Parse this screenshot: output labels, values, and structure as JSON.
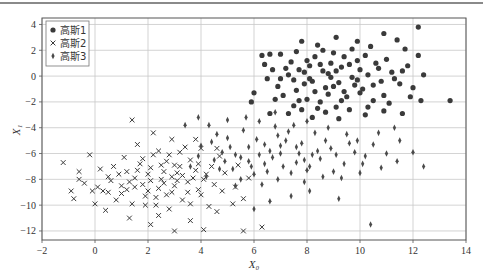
{
  "chart_data": {
    "type": "scatter",
    "title": "",
    "xlabel": "X₀",
    "ylabel": "X₁",
    "xlim": [
      -2,
      14
    ],
    "ylim": [
      -12.7,
      4.5
    ],
    "xticks": [
      -2,
      0,
      2,
      4,
      6,
      8,
      10,
      12,
      14
    ],
    "yticks": [
      -12,
      -10,
      -8,
      -6,
      -4,
      -2,
      0,
      2,
      4
    ],
    "xtick_labels": [
      "−2",
      "0",
      "2",
      "4",
      "6",
      "8",
      "10",
      "12",
      "14"
    ],
    "ytick_labels": [
      "−12",
      "−10",
      "−8",
      "−6",
      "−4",
      "−2",
      "0",
      "2",
      "4"
    ],
    "grid": true,
    "legend_position": "top-left",
    "series": [
      {
        "name": "高斯1",
        "marker": "circle",
        "color": "#3a3a3a",
        "points": [
          [
            8.8,
            0.2
          ],
          [
            9.2,
            -0.5
          ],
          [
            8.1,
            0.8
          ],
          [
            9.9,
            1.2
          ],
          [
            7.6,
            -1.1
          ],
          [
            8.5,
            -2.0
          ],
          [
            10.3,
            0.1
          ],
          [
            9.0,
            1.8
          ],
          [
            7.9,
            0.3
          ],
          [
            8.7,
            -0.9
          ],
          [
            10.8,
            -0.4
          ],
          [
            9.5,
            -1.6
          ],
          [
            7.2,
            0.6
          ],
          [
            8.3,
            1.5
          ],
          [
            9.7,
            2.1
          ],
          [
            10.1,
            -1.0
          ],
          [
            8.9,
            -0.1
          ],
          [
            7.5,
            -0.3
          ],
          [
            9.3,
            0.7
          ],
          [
            8.0,
            -1.8
          ],
          [
            6.9,
            -0.8
          ],
          [
            10.6,
            1.0
          ],
          [
            11.2,
            0.3
          ],
          [
            9.1,
            -2.4
          ],
          [
            8.4,
            2.4
          ],
          [
            7.0,
            1.7
          ],
          [
            6.5,
            -0.2
          ],
          [
            9.8,
            -0.7
          ],
          [
            10.9,
            -1.5
          ],
          [
            8.6,
            0.4
          ],
          [
            7.8,
            -2.6
          ],
          [
            9.6,
            0.9
          ],
          [
            10.4,
            2.3
          ],
          [
            11.5,
            -0.6
          ],
          [
            8.2,
            -0.4
          ],
          [
            7.4,
            1.1
          ],
          [
            6.7,
            0.5
          ],
          [
            9.4,
            -1.2
          ],
          [
            10.0,
            0.5
          ],
          [
            8.8,
            -1.4
          ],
          [
            7.1,
            -1.5
          ],
          [
            11.8,
            0.8
          ],
          [
            12.0,
            -0.9
          ],
          [
            12.2,
            1.6
          ],
          [
            11.9,
            -1.6
          ],
          [
            12.3,
            -1.9
          ],
          [
            13.4,
            -1.9
          ],
          [
            12.2,
            3.8
          ],
          [
            10.9,
            3.3
          ],
          [
            11.4,
            2.8
          ],
          [
            9.9,
            2.7
          ],
          [
            9.1,
            3.0
          ],
          [
            7.8,
            2.7
          ],
          [
            6.6,
            1.7
          ],
          [
            6.3,
            1.6
          ],
          [
            6.0,
            -1.3
          ],
          [
            5.9,
            -2.0
          ],
          [
            6.6,
            -2.9
          ],
          [
            7.3,
            -2.9
          ],
          [
            8.2,
            -3.2
          ],
          [
            9.2,
            -3.3
          ],
          [
            10.2,
            -3.0
          ],
          [
            10.9,
            -2.7
          ],
          [
            11.6,
            -2.9
          ],
          [
            9.6,
            -2.6
          ],
          [
            8.4,
            -2.5
          ],
          [
            7.7,
            -1.9
          ],
          [
            10.5,
            -1.9
          ],
          [
            11.1,
            -2.1
          ],
          [
            6.8,
            -1.8
          ],
          [
            8.0,
            1.2
          ],
          [
            8.9,
            1.0
          ],
          [
            9.4,
            1.5
          ],
          [
            10.2,
            1.6
          ],
          [
            7.3,
            0.1
          ],
          [
            7.9,
            -0.6
          ],
          [
            8.3,
            -1.2
          ],
          [
            9.0,
            -0.8
          ],
          [
            9.9,
            -0.3
          ],
          [
            10.7,
            0.6
          ],
          [
            11.3,
            -0.2
          ],
          [
            11.0,
            1.3
          ],
          [
            8.6,
            2.0
          ],
          [
            7.6,
            1.9
          ],
          [
            6.4,
            0.9
          ],
          [
            7.0,
            -0.2
          ],
          [
            9.3,
            -1.9
          ],
          [
            10.3,
            -2.4
          ],
          [
            8.7,
            -2.8
          ],
          [
            7.5,
            -2.3
          ],
          [
            9.7,
            -0.1
          ],
          [
            8.5,
            0.9
          ],
          [
            9.1,
            0.4
          ],
          [
            10.0,
            -1.3
          ],
          [
            8.1,
            -0.2
          ],
          [
            7.7,
            0.5
          ],
          [
            10.5,
            -0.7
          ],
          [
            11.6,
            0.4
          ],
          [
            12.4,
            0.1
          ],
          [
            11.7,
            2.1
          ]
        ]
      },
      {
        "name": "高斯2",
        "marker": "x",
        "color": "#3a3a3a",
        "points": [
          [
            2.5,
            -8.0
          ],
          [
            3.1,
            -7.5
          ],
          [
            1.8,
            -8.4
          ],
          [
            2.9,
            -9.0
          ],
          [
            3.5,
            -8.2
          ],
          [
            2.1,
            -7.1
          ],
          [
            1.5,
            -7.9
          ],
          [
            3.8,
            -7.3
          ],
          [
            2.7,
            -6.6
          ],
          [
            1.2,
            -8.8
          ],
          [
            3.3,
            -9.6
          ],
          [
            4.1,
            -8.0
          ],
          [
            2.3,
            -9.4
          ],
          [
            1.7,
            -6.8
          ],
          [
            0.9,
            -7.6
          ],
          [
            4.4,
            -7.0
          ],
          [
            3.0,
            -8.5
          ],
          [
            2.0,
            -8.9
          ],
          [
            2.6,
            -7.4
          ],
          [
            3.6,
            -6.5
          ],
          [
            1.4,
            -9.9
          ],
          [
            4.0,
            -9.2
          ],
          [
            2.8,
            -10.3
          ],
          [
            1.1,
            -6.3
          ],
          [
            0.6,
            -8.1
          ],
          [
            4.7,
            -6.2
          ],
          [
            3.9,
            -8.8
          ],
          [
            2.2,
            -6.1
          ],
          [
            1.9,
            -10.0
          ],
          [
            3.2,
            -7.0
          ],
          [
            0.3,
            -8.9
          ],
          [
            4.3,
            -10.1
          ],
          [
            2.4,
            -5.8
          ],
          [
            1.6,
            -5.3
          ],
          [
            3.4,
            -5.5
          ],
          [
            0.8,
            -9.6
          ],
          [
            2.9,
            -4.9
          ],
          [
            4.9,
            -7.5
          ],
          [
            5.3,
            -8.6
          ],
          [
            5.6,
            -9.5
          ],
          [
            1.4,
            -3.4
          ],
          [
            2.2,
            -4.4
          ],
          [
            -1.2,
            -6.7
          ],
          [
            -0.6,
            -7.4
          ],
          [
            -0.6,
            -8.0
          ],
          [
            -0.4,
            -8.3
          ],
          [
            -0.9,
            -8.9
          ],
          [
            -0.8,
            -9.5
          ],
          [
            -0.2,
            -6.1
          ],
          [
            0.0,
            -9.9
          ],
          [
            0.1,
            -8.6
          ],
          [
            0.5,
            -7.8
          ],
          [
            0.2,
            -7.2
          ],
          [
            -0.1,
            -8.9
          ],
          [
            0.4,
            -10.4
          ],
          [
            1.0,
            -9.1
          ],
          [
            1.3,
            -11.0
          ],
          [
            2.1,
            -11.5
          ],
          [
            2.4,
            -10.8
          ],
          [
            3.0,
            -12.0
          ],
          [
            3.6,
            -11.2
          ],
          [
            4.1,
            -11.9
          ],
          [
            4.6,
            -10.5
          ],
          [
            5.2,
            -9.9
          ],
          [
            5.6,
            -12.0
          ],
          [
            6.3,
            -11.7
          ],
          [
            5.8,
            -7.9
          ],
          [
            5.4,
            -6.9
          ],
          [
            4.6,
            -5.6
          ],
          [
            3.8,
            -4.9
          ],
          [
            2.6,
            -8.3
          ],
          [
            3.1,
            -8.1
          ],
          [
            2.0,
            -7.6
          ],
          [
            2.4,
            -8.7
          ],
          [
            3.7,
            -7.9
          ],
          [
            1.6,
            -7.3
          ],
          [
            4.2,
            -7.6
          ],
          [
            3.0,
            -6.9
          ],
          [
            2.7,
            -9.2
          ],
          [
            1.9,
            -9.3
          ],
          [
            3.5,
            -9.0
          ],
          [
            1.3,
            -8.2
          ],
          [
            0.7,
            -7.0
          ],
          [
            4.5,
            -8.4
          ],
          [
            2.5,
            -6.9
          ],
          [
            3.3,
            -7.7
          ],
          [
            2.1,
            -8.1
          ],
          [
            1.8,
            -6.4
          ],
          [
            3.9,
            -6.8
          ],
          [
            2.9,
            -7.8
          ],
          [
            1.0,
            -8.5
          ],
          [
            4.8,
            -8.9
          ],
          [
            3.6,
            -9.9
          ],
          [
            2.3,
            -10.0
          ],
          [
            1.5,
            -8.6
          ],
          [
            2.8,
            -6.1
          ],
          [
            0.5,
            -9.0
          ],
          [
            3.2,
            -5.9
          ],
          [
            4.0,
            -5.6
          ],
          [
            1.2,
            -7.4
          ]
        ]
      },
      {
        "name": "高斯3",
        "marker": "thin_diamond",
        "color": "#4a4a4a",
        "points": [
          [
            7.0,
            -6.0
          ],
          [
            7.8,
            -5.2
          ],
          [
            6.4,
            -6.8
          ],
          [
            8.5,
            -6.4
          ],
          [
            5.8,
            -5.5
          ],
          [
            7.4,
            -7.5
          ],
          [
            6.9,
            -4.6
          ],
          [
            8.1,
            -7.0
          ],
          [
            5.5,
            -6.3
          ],
          [
            6.1,
            -4.9
          ],
          [
            7.6,
            -6.7
          ],
          [
            8.9,
            -5.6
          ],
          [
            5.2,
            -7.2
          ],
          [
            6.6,
            -5.8
          ],
          [
            9.4,
            -6.8
          ],
          [
            4.8,
            -5.9
          ],
          [
            7.2,
            -5.0
          ],
          [
            8.3,
            -4.4
          ],
          [
            6.0,
            -7.6
          ],
          [
            5.0,
            -4.8
          ],
          [
            7.9,
            -8.2
          ],
          [
            9.0,
            -7.4
          ],
          [
            4.5,
            -6.5
          ],
          [
            6.3,
            -8.4
          ],
          [
            8.7,
            -5.0
          ],
          [
            5.6,
            -4.2
          ],
          [
            7.5,
            -3.8
          ],
          [
            9.8,
            -5.9
          ],
          [
            4.2,
            -7.8
          ],
          [
            6.8,
            -3.9
          ],
          [
            10.2,
            -6.2
          ],
          [
            9.5,
            -4.5
          ],
          [
            5.3,
            -8.5
          ],
          [
            8.0,
            -3.5
          ],
          [
            6.2,
            -3.5
          ],
          [
            4.6,
            -4.5
          ],
          [
            10.5,
            -5.3
          ],
          [
            11.0,
            -6.0
          ],
          [
            11.5,
            -5.0
          ],
          [
            10.7,
            -4.4
          ],
          [
            11.4,
            -6.6
          ],
          [
            10.0,
            -7.5
          ],
          [
            12.0,
            -5.9
          ],
          [
            12.4,
            -7.0
          ],
          [
            9.2,
            -9.5
          ],
          [
            8.1,
            -8.9
          ],
          [
            7.4,
            -9.3
          ],
          [
            6.6,
            -9.7
          ],
          [
            10.4,
            -11.5
          ],
          [
            6.0,
            -10.3
          ],
          [
            5.0,
            -3.4
          ],
          [
            4.3,
            -3.8
          ],
          [
            3.4,
            -3.8
          ],
          [
            3.9,
            -3.2
          ],
          [
            5.7,
            -3.2
          ],
          [
            6.8,
            -2.8
          ],
          [
            5.3,
            -6.1
          ],
          [
            6.7,
            -6.3
          ],
          [
            7.7,
            -6.0
          ],
          [
            8.6,
            -7.8
          ],
          [
            9.1,
            -6.1
          ],
          [
            7.1,
            -7.0
          ],
          [
            6.4,
            -5.3
          ],
          [
            5.9,
            -7.0
          ],
          [
            7.9,
            -6.5
          ],
          [
            8.4,
            -5.8
          ],
          [
            6.9,
            -8.0
          ],
          [
            5.1,
            -5.5
          ],
          [
            4.7,
            -7.2
          ],
          [
            7.3,
            -4.3
          ],
          [
            8.8,
            -4.0
          ],
          [
            9.6,
            -5.2
          ],
          [
            10.1,
            -6.8
          ],
          [
            4.4,
            -5.1
          ],
          [
            5.5,
            -8.0
          ],
          [
            6.5,
            -7.4
          ],
          [
            8.2,
            -6.1
          ],
          [
            7.6,
            -5.5
          ],
          [
            9.3,
            -7.9
          ],
          [
            5.8,
            -6.6
          ],
          [
            6.2,
            -6.1
          ],
          [
            7.0,
            -5.4
          ],
          [
            8.0,
            -7.3
          ],
          [
            9.9,
            -5.0
          ],
          [
            10.8,
            -7.1
          ],
          [
            4.9,
            -6.6
          ],
          [
            3.9,
            -6.2
          ],
          [
            3.6,
            -7.0
          ],
          [
            4.0,
            -5.4
          ],
          [
            11.3,
            -4.0
          ]
        ]
      }
    ]
  }
}
